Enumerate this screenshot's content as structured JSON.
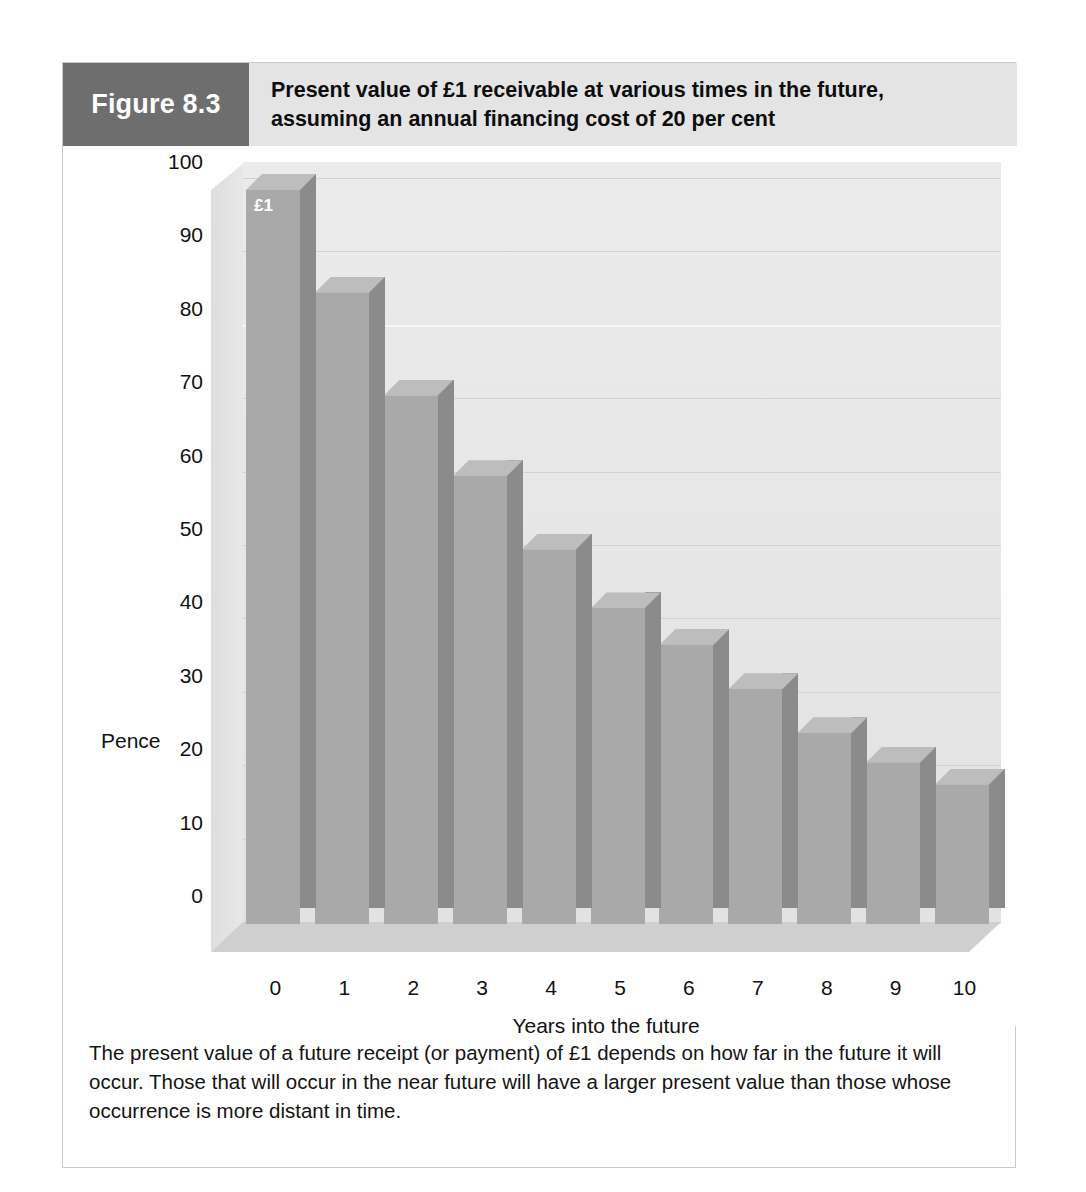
{
  "figure": {
    "number_label": "Figure 8.3",
    "title_line1": "Present value of £1 receivable at various times in the future,",
    "title_line2": "assuming an annual financing cost of 20 per cent",
    "caption": "The present value of a future receipt (or payment) of £1 depends on how far in the future it will occur. Those that will occur in the near future will have a larger present value than those whose occurrence is more distant in time."
  },
  "colors": {
    "figure_number_bg": "#6e6e6e",
    "title_bg": "#e4e4e4",
    "bar_face": "#a9a9a9",
    "bar_side": "#8b8b8b",
    "bar_top": "#bdbdbd",
    "plot_bg": "#e6e6e6",
    "frame_border": "#c9c9c9"
  },
  "chart_data": {
    "type": "bar",
    "title": "Present value of £1 receivable at various times in the future, assuming an annual financing cost of 20 per cent",
    "xlabel": "Years into the future",
    "ylabel": "Pence",
    "categories": [
      "0",
      "1",
      "2",
      "3",
      "4",
      "5",
      "6",
      "7",
      "8",
      "9",
      "10"
    ],
    "values": [
      100,
      86,
      72,
      61,
      51,
      43,
      38,
      32,
      26,
      22,
      19
    ],
    "ylim": [
      0,
      100
    ],
    "yticks": [
      0,
      10,
      20,
      30,
      40,
      50,
      60,
      70,
      80,
      90,
      100
    ],
    "ytick_labels": [
      "0",
      "10",
      "20",
      "30",
      "40",
      "50",
      "60",
      "70",
      "80",
      "90",
      "100"
    ],
    "grid": true,
    "legend": null,
    "annotations": [
      {
        "text": "£1",
        "series_index": 0,
        "category": "0"
      }
    ],
    "style": "3d-column"
  }
}
